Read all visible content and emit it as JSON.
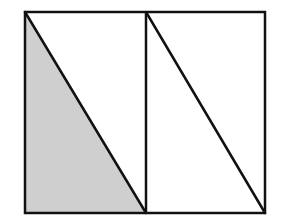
{
  "diagram": {
    "colors": {
      "background": "#ffffff",
      "stroke": "#111111",
      "shade": "#cfcfcf"
    },
    "stroke_width": 2.5,
    "outer_rect": {
      "x1": 25,
      "y1": 12,
      "x2": 265,
      "y2": 213
    },
    "divider_x": 146,
    "shaded_triangle": [
      [
        25,
        12
      ],
      [
        25,
        213
      ],
      [
        146,
        213
      ]
    ],
    "diagonals": [
      {
        "from": [
          25,
          12
        ],
        "to": [
          146,
          213
        ]
      },
      {
        "from": [
          146,
          12
        ],
        "to": [
          265,
          213
        ]
      }
    ]
  }
}
